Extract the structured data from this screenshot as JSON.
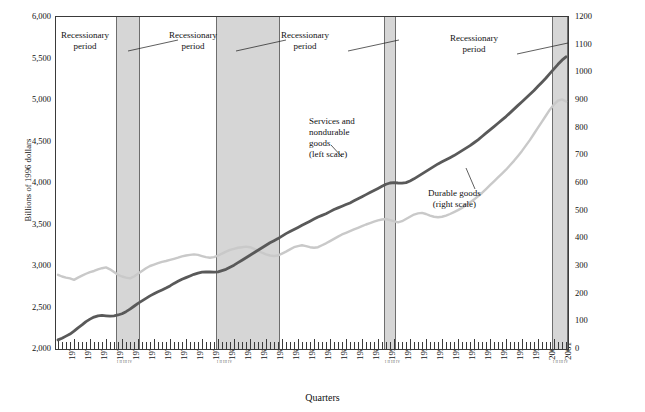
{
  "chart_data": {
    "type": "line",
    "title": "",
    "xlabel": "Quarters",
    "ylabel_left": "Billions of 1996 dollars",
    "ylabel_right": "Billions of 1996 dollars",
    "ylim_left": [
      2000,
      6000
    ],
    "ylim_right": [
      0,
      1200
    ],
    "ytick_left": [
      "2,000",
      "2,500",
      "3,000",
      "3,500",
      "4,000",
      "4,500",
      "5,000",
      "5,500",
      "6,000"
    ],
    "ytick_right": [
      "0",
      "100",
      "200",
      "300",
      "400",
      "500",
      "600",
      "700",
      "800",
      "900",
      "1000",
      "1100",
      "1200"
    ],
    "grid": false,
    "legend": "annotations",
    "x_start_year": 1970,
    "x_end_year": 2001,
    "xtick_labels": [
      "1970",
      "1971",
      "1972",
      "1973",
      "1974",
      "1975",
      "1976",
      "1977",
      "1978",
      "1979",
      "1980",
      "1981",
      "1982",
      "1983",
      "1984",
      "1985",
      "1986",
      "1987",
      "1988",
      "1989",
      "1990",
      "1991",
      "1992",
      "1993",
      "1994",
      "1995",
      "1996",
      "1997",
      "1998",
      "1999",
      "2000",
      "2001"
    ],
    "series": [
      {
        "name": "Services and nondurable goods (left scale)",
        "axis": "left",
        "color": "#595959",
        "values": [
          2110,
          2130,
          2155,
          2180,
          2215,
          2255,
          2290,
          2330,
          2360,
          2385,
          2400,
          2405,
          2400,
          2395,
          2400,
          2410,
          2425,
          2450,
          2480,
          2515,
          2550,
          2580,
          2610,
          2640,
          2665,
          2690,
          2712,
          2735,
          2760,
          2790,
          2815,
          2840,
          2860,
          2880,
          2900,
          2915,
          2925,
          2930,
          2928,
          2925,
          2930,
          2945,
          2960,
          2985,
          3010,
          3040,
          3070,
          3100,
          3130,
          3160,
          3190,
          3220,
          3250,
          3280,
          3305,
          3330,
          3360,
          3390,
          3415,
          3440,
          3465,
          3490,
          3515,
          3540,
          3565,
          3590,
          3610,
          3630,
          3655,
          3680,
          3700,
          3720,
          3740,
          3760,
          3785,
          3810,
          3835,
          3860,
          3885,
          3910,
          3935,
          3960,
          3985,
          4000,
          4005,
          4000,
          3998,
          4005,
          4025,
          4050,
          4080,
          4110,
          4140,
          4170,
          4200,
          4230,
          4255,
          4280,
          4305,
          4330,
          4360,
          4390,
          4420,
          4450,
          4485,
          4520,
          4560,
          4600,
          4640,
          4680,
          4720,
          4760,
          4800,
          4845,
          4890,
          4935,
          4980,
          5025,
          5070,
          5115,
          5165,
          5215,
          5265,
          5320,
          5375,
          5430,
          5480,
          5520
        ]
      },
      {
        "name": "Durable goods (right scale)",
        "axis": "right",
        "color": "#c9c9c9",
        "values": [
          268,
          262,
          258,
          255,
          250,
          258,
          265,
          272,
          278,
          282,
          288,
          292,
          295,
          288,
          278,
          268,
          262,
          258,
          255,
          262,
          272,
          282,
          292,
          300,
          305,
          310,
          315,
          318,
          322,
          326,
          330,
          335,
          338,
          340,
          342,
          340,
          336,
          332,
          330,
          332,
          338,
          345,
          352,
          358,
          362,
          366,
          368,
          370,
          368,
          362,
          355,
          348,
          342,
          338,
          336,
          338,
          345,
          352,
          360,
          368,
          372,
          375,
          372,
          368,
          366,
          368,
          375,
          382,
          390,
          398,
          406,
          414,
          420,
          426,
          432,
          438,
          444,
          450,
          455,
          460,
          465,
          468,
          470,
          466,
          462,
          458,
          462,
          470,
          478,
          486,
          490,
          492,
          488,
          482,
          478,
          476,
          478,
          482,
          488,
          495,
          502,
          510,
          520,
          530,
          540,
          552,
          564,
          578,
          592,
          606,
          620,
          634,
          648,
          664,
          680,
          698,
          716,
          736,
          756,
          778,
          800,
          822,
          844,
          866,
          884,
          898,
          902,
          895
        ]
      }
    ],
    "recession_bands": [
      {
        "label": "Recessionary period",
        "start": "1973Q4",
        "end": "1975Q1"
      },
      {
        "label": "Recessionary period",
        "start": "1980Q1",
        "end": "1983Q4"
      },
      {
        "label": "Recessionary period",
        "start": "1990Q3",
        "end": "1991Q1"
      },
      {
        "label": "Recessionary period",
        "start": "2001Q1",
        "end": "2001Q4"
      }
    ],
    "annotations": [
      {
        "name": "recession-label-1",
        "text_line1": "Recessionary",
        "text_line2": "period"
      },
      {
        "name": "recession-label-2",
        "text_line1": "Recessionary",
        "text_line2": "period"
      },
      {
        "name": "recession-label-3",
        "text_line1": "Recessionary",
        "text_line2": "period"
      },
      {
        "name": "recession-label-4",
        "text_line1": "Recessionary",
        "text_line2": "period"
      },
      {
        "name": "series-label-services",
        "line1": "Services and",
        "line2": "nondurable",
        "line3": "goods",
        "line4": "(left scale)"
      },
      {
        "name": "series-label-durable",
        "line1": "Durable goods",
        "line2": "(right scale)"
      }
    ]
  }
}
